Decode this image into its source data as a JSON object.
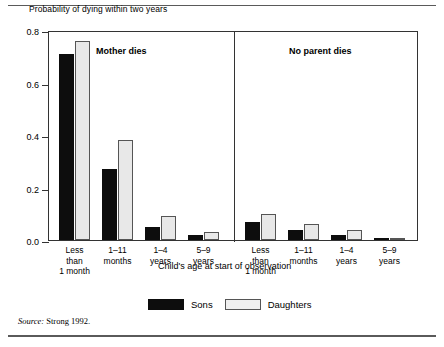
{
  "chart_data": {
    "type": "bar",
    "title": "",
    "ylabel": "Probability of dying within two years",
    "xlabel": "Child's age at start of observation",
    "ylim": [
      0,
      0.8
    ],
    "yticks": [
      "0.0",
      "0.2",
      "0.4",
      "0.6",
      "0.8"
    ],
    "ytick_values": [
      0.0,
      0.2,
      0.4,
      0.6,
      0.8
    ],
    "grid": false,
    "legend_position": "bottom-center",
    "categories": [
      "Less than 1 month",
      "1–11 months",
      "1–4 years",
      "5–9 years"
    ],
    "panels": [
      {
        "name": "Mother dies",
        "series": [
          {
            "name": "Sons",
            "values": [
              0.71,
              0.27,
              0.05,
              0.02
            ]
          },
          {
            "name": "Daughters",
            "values": [
              0.76,
              0.38,
              0.09,
              0.03
            ]
          }
        ]
      },
      {
        "name": "No parent dies",
        "series": [
          {
            "name": "Sons",
            "values": [
              0.07,
              0.04,
              0.02,
              0.005
            ]
          },
          {
            "name": "Daughters",
            "values": [
              0.1,
              0.06,
              0.04,
              0.005
            ]
          }
        ]
      }
    ],
    "legend": [
      {
        "label": "Sons",
        "color": "#0d0d0d"
      },
      {
        "label": "Daughters",
        "color": "#e8e8e8"
      }
    ],
    "source_prefix": "Source:",
    "source_text": "Strong 1992."
  },
  "xlabels": [
    {
      "lines": [
        "Less",
        "than",
        "1 month"
      ]
    },
    {
      "lines": [
        "1–11",
        "months"
      ]
    },
    {
      "lines": [
        "1–4",
        "years"
      ]
    },
    {
      "lines": [
        "5–9",
        "years"
      ]
    }
  ]
}
